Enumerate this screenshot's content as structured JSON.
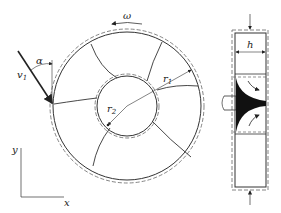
{
  "figure": {
    "labels": {
      "omega": "ω",
      "alpha": "α",
      "v1": "v",
      "v1_sub": "1",
      "r1": "r",
      "r1_sub": "1",
      "r2": "r",
      "r2_sub": "2",
      "h": "h",
      "x": "x",
      "y": "y"
    },
    "front_view": {
      "center": [
        127,
        106
      ],
      "outer_radius": 74,
      "inner_radius": 30,
      "blade_count": 7
    },
    "side_view": {
      "width_label": "h"
    },
    "colors": {
      "line": "#333333",
      "dashed": "#666666",
      "fill": "#111111"
    }
  }
}
